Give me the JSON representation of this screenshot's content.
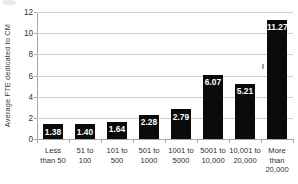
{
  "chart_data": {
    "type": "bar",
    "title": "",
    "xlabel": "",
    "ylabel": "Average FTE dedicated to CM",
    "ylim": [
      0,
      12
    ],
    "yticks": [
      0,
      2,
      4,
      6,
      8,
      10,
      12
    ],
    "ytick_labels": [
      "0",
      "2",
      "4",
      "6",
      "8",
      "10",
      "12"
    ],
    "grid": "horizontal",
    "legend": "none",
    "bar_color": "#0a0a0a",
    "label_color": "#ffffff",
    "gridline_color": "#d0d0d0",
    "axis_color": "#a6a6a6",
    "categories": [
      "Less than 50",
      "51 to 100",
      "101 to 500",
      "501 to 1000",
      "1001 to 5000",
      "5001 to 10,000",
      "10,001 to 20,000",
      "More than 20,000"
    ],
    "category_lines": [
      [
        "Less",
        "than 50"
      ],
      [
        "51 to",
        "100"
      ],
      [
        "101 to",
        "500"
      ],
      [
        "501 to",
        "1000"
      ],
      [
        "1001 to",
        "5000"
      ],
      [
        "5001 to",
        "10,000"
      ],
      [
        "10,001 to",
        "20,000"
      ],
      [
        "More",
        "than",
        "20,000"
      ]
    ],
    "values": [
      1.38,
      1.4,
      1.64,
      2.28,
      2.79,
      6.07,
      5.21,
      11.27
    ],
    "value_labels": [
      "1.38",
      "1.40",
      "1.64",
      "2.28",
      "2.79",
      "6.07",
      "5.21",
      "11.27"
    ]
  }
}
